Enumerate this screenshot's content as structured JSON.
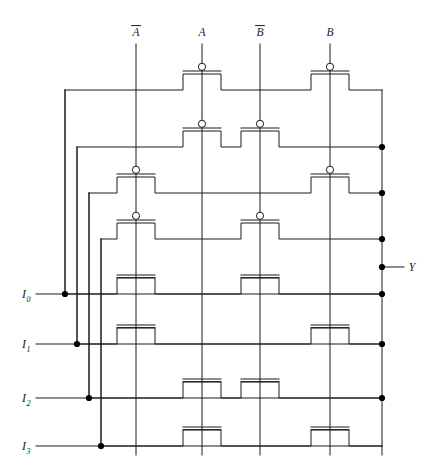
{
  "figure": {
    "kind": "cmos-transistor-level-schematic",
    "width": 440,
    "height": 472,
    "line_color": "#1a1a1a",
    "background": "#ffffff",
    "node_dot_color": "#000000"
  },
  "select_signals": [
    {
      "name": "A-bar",
      "label": "A",
      "overbar": true,
      "x": 136,
      "y_label": 36,
      "y_top": 44,
      "y_bottom": 455
    },
    {
      "name": "A",
      "label": "A",
      "overbar": false,
      "x": 202,
      "y_label": 36,
      "y_top": 44,
      "y_bottom": 455
    },
    {
      "name": "B-bar",
      "label": "B",
      "overbar": true,
      "x": 260,
      "y_label": 36,
      "y_top": 44,
      "y_bottom": 455
    },
    {
      "name": "B",
      "label": "B",
      "overbar": false,
      "x": 330,
      "y_label": 36,
      "y_top": 44,
      "y_bottom": 455
    }
  ],
  "data_inputs": [
    {
      "name": "I0",
      "label": "I",
      "sub": "0",
      "y": 294,
      "label_x": 24,
      "stub_x0": 36,
      "bus_x": 65,
      "turn_y": 90
    },
    {
      "name": "I1",
      "label": "I",
      "sub": "1",
      "y": 344,
      "label_x": 24,
      "stub_x0": 36,
      "bus_x": 77,
      "turn_y": 147
    },
    {
      "name": "I2",
      "label": "I",
      "sub": "2",
      "y": 398,
      "label_x": 24,
      "stub_x0": 36,
      "bus_x": 89,
      "turn_y": 193
    },
    {
      "name": "I3",
      "label": "I",
      "sub": "3",
      "y": 446,
      "label_x": 24,
      "stub_x0": 36,
      "bus_x": 101,
      "turn_y": 239
    }
  ],
  "output": {
    "name": "Y",
    "label": "Y",
    "label_x": 412,
    "y": 267,
    "bus_x": 382,
    "stub_x1": 404,
    "bus_y_top": 90,
    "bus_y_bottom": 455
  },
  "rows": [
    {
      "index": 1,
      "y": 90,
      "type": "pmos",
      "left_x": 65,
      "right_x": 382,
      "dot_right": false,
      "transistors": [
        {
          "gate": "A",
          "x": 202
        },
        {
          "gate": "B",
          "x": 330
        }
      ]
    },
    {
      "index": 2,
      "y": 147,
      "type": "pmos",
      "left_x": 77,
      "right_x": 382,
      "dot_right": true,
      "transistors": [
        {
          "gate": "A",
          "x": 202
        },
        {
          "gate": "B-bar",
          "x": 260
        }
      ]
    },
    {
      "index": 3,
      "y": 193,
      "type": "pmos",
      "left_x": 89,
      "right_x": 382,
      "dot_right": true,
      "transistors": [
        {
          "gate": "A-bar",
          "x": 136
        },
        {
          "gate": "B",
          "x": 330
        }
      ]
    },
    {
      "index": 4,
      "y": 239,
      "type": "pmos",
      "left_x": 101,
      "right_x": 382,
      "dot_right": true,
      "transistors": [
        {
          "gate": "A-bar",
          "x": 136
        },
        {
          "gate": "B-bar",
          "x": 260
        }
      ]
    },
    {
      "index": 5,
      "y": 294,
      "type": "nmos",
      "left_x": 65,
      "right_x": 382,
      "dot_right": true,
      "transistors": [
        {
          "gate": "A-bar",
          "x": 136
        },
        {
          "gate": "B-bar",
          "x": 260
        }
      ]
    },
    {
      "index": 6,
      "y": 344,
      "type": "nmos",
      "left_x": 77,
      "right_x": 382,
      "dot_right": true,
      "transistors": [
        {
          "gate": "A-bar",
          "x": 136
        },
        {
          "gate": "B",
          "x": 330
        }
      ]
    },
    {
      "index": 7,
      "y": 398,
      "type": "nmos",
      "left_x": 89,
      "right_x": 382,
      "dot_right": true,
      "transistors": [
        {
          "gate": "A",
          "x": 202
        },
        {
          "gate": "B-bar",
          "x": 260
        }
      ]
    },
    {
      "index": 8,
      "y": 446,
      "type": "nmos",
      "left_x": 101,
      "right_x": 382,
      "dot_right": false,
      "transistors": [
        {
          "gate": "A",
          "x": 202
        },
        {
          "gate": "B",
          "x": 330
        }
      ]
    }
  ],
  "junction_dots": [
    {
      "name": "I0-bus-tap",
      "x": 65,
      "y": 294
    },
    {
      "name": "I1-bus-tap",
      "x": 77,
      "y": 344
    },
    {
      "name": "I2-bus-tap",
      "x": 89,
      "y": 398
    },
    {
      "name": "I3-bus-tap",
      "x": 101,
      "y": 446
    },
    {
      "name": "out-tap-row2",
      "x": 382,
      "y": 147
    },
    {
      "name": "out-tap-row3",
      "x": 382,
      "y": 193
    },
    {
      "name": "out-tap-row4",
      "x": 382,
      "y": 239
    },
    {
      "name": "out-tap-Y",
      "x": 382,
      "y": 267
    },
    {
      "name": "out-tap-row5",
      "x": 382,
      "y": 294
    },
    {
      "name": "out-tap-row6",
      "x": 382,
      "y": 344
    },
    {
      "name": "out-tap-row7",
      "x": 382,
      "y": 398
    }
  ],
  "geometry": {
    "transistor_half_width": 19,
    "transistor_step_height": 16,
    "gate_bar_half_width": 19,
    "gate_bar_gap": 3,
    "bubble_radius": 3.6,
    "stroke_width": 1
  }
}
